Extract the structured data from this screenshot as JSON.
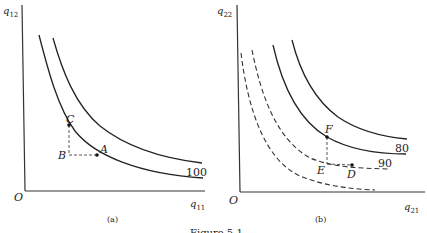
{
  "figure": {
    "caption": "Figure 5.1"
  },
  "panels": [
    {
      "id": "a",
      "label": "(a)",
      "origin_label": "O",
      "y_axis_label": "q12",
      "y_axis_sub": "12",
      "x_axis_label": "q11",
      "x_axis_sub": "11",
      "curves": [
        {
          "style": "solid",
          "label": "100"
        },
        {
          "style": "solid",
          "label": ""
        }
      ],
      "points": [
        {
          "label": "A"
        },
        {
          "label": "B"
        },
        {
          "label": "C"
        }
      ]
    },
    {
      "id": "b",
      "label": "(b)",
      "origin_label": "O",
      "y_axis_label": "q22",
      "y_axis_sub": "22",
      "x_axis_label": "q21",
      "x_axis_sub": "21",
      "curves": [
        {
          "style": "solid",
          "label": "80"
        },
        {
          "style": "dashed",
          "label": "90"
        },
        {
          "style": "solid",
          "label": ""
        },
        {
          "style": "dashed",
          "label": ""
        }
      ],
      "points": [
        {
          "label": "D"
        },
        {
          "label": "E"
        },
        {
          "label": "F"
        }
      ]
    }
  ]
}
